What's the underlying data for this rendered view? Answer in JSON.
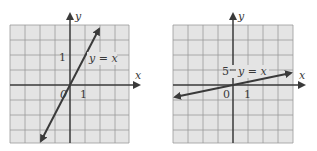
{
  "colors": {
    "grid_bg": "#e4e4e4",
    "grid_line": "#9a9a9a",
    "axis": "#3a3a3a",
    "line": "#3a3a3a"
  },
  "graphs": [
    {
      "id": "left",
      "x_axis_label": "x",
      "y_axis_label": "y",
      "origin_label": "0",
      "x_tick_label": "1",
      "y_tick_label": "1",
      "line_label": "y = x",
      "description": "steep line through origin"
    },
    {
      "id": "right",
      "x_axis_label": "x",
      "y_axis_label": "y",
      "origin_label": "0",
      "x_tick_label": "1",
      "y_tick_label": "5",
      "line_label": "y = x",
      "description": "shallow line through origin"
    }
  ]
}
